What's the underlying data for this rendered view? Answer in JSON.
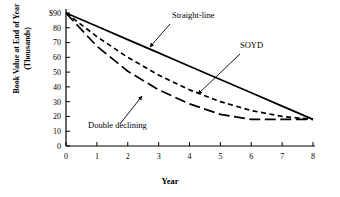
{
  "chart_data": {
    "type": "line",
    "title": "",
    "xlabel": "Year",
    "ylabel": "Book Value at End of Year (Thousands)",
    "ylabel_line1": "Book Value at End of Year",
    "ylabel_line2": "(Thousands)",
    "xlim": [
      0,
      8
    ],
    "ylim": [
      0,
      90
    ],
    "x_ticks": [
      "0",
      "1",
      "2",
      "3",
      "4",
      "5",
      "6",
      "7",
      "8"
    ],
    "x_tick_values": [
      0,
      1,
      2,
      3,
      4,
      5,
      6,
      7,
      8
    ],
    "y_ticks": [
      "0",
      "10",
      "20",
      "30",
      "40",
      "50",
      "60",
      "70",
      "80",
      "$90"
    ],
    "y_tick_values": [
      0,
      10,
      20,
      30,
      40,
      50,
      60,
      70,
      80,
      90
    ],
    "grid": false,
    "legend_position": "inline-annotations",
    "x": [
      0,
      1,
      2,
      3,
      4,
      5,
      6,
      7,
      8
    ],
    "series": [
      {
        "name": "Straight-line",
        "style": "solid",
        "color": "#000000",
        "values": [
          90,
          81,
          72,
          63,
          54,
          45,
          36,
          27,
          18
        ]
      },
      {
        "name": "SOYD",
        "style": "dashed",
        "color": "#000000",
        "values": [
          90,
          74,
          60,
          48,
          38,
          30,
          24,
          20,
          18
        ]
      },
      {
        "name": "Double declining",
        "style": "long-dashed",
        "color": "#000000",
        "values": [
          90,
          67.5,
          50.6,
          38,
          28.5,
          21.4,
          18,
          18,
          18
        ]
      }
    ],
    "annotations": [
      {
        "text": "Straight-line",
        "label_x": 172,
        "label_y": 18,
        "leader_from_x": 170,
        "leader_from_y": 24,
        "leader_to_x": 150,
        "leader_to_y": 47
      },
      {
        "text": "SOYD",
        "label_x": 240,
        "label_y": 48,
        "leader_from_x": 240,
        "leader_from_y": 54,
        "leader_to_x": 198,
        "leader_to_y": 94
      },
      {
        "text": "Double declining",
        "label_x": 88,
        "label_y": 128,
        "leader_from_x": 120,
        "leader_from_y": 124,
        "leader_to_x": 142,
        "leader_to_y": 96
      }
    ],
    "axis_origin_px": {
      "x": 66,
      "y": 146
    },
    "axis_end_px": {
      "x": 313,
      "y": 13
    },
    "salvage_value": 18,
    "initial_value": 90
  }
}
